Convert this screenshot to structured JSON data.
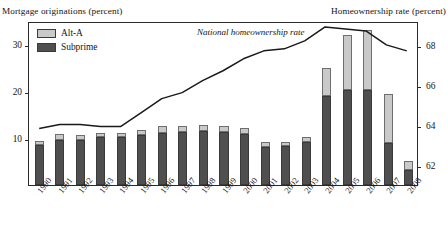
{
  "axis_captions": {
    "left": "Mortgage originations (percent)",
    "right": "Homeownership rate (percent)"
  },
  "legend": {
    "items": [
      {
        "label": "Alt-A",
        "color": "#c9c9c9",
        "name": "legend-alt-a"
      },
      {
        "label": "Subprime",
        "color": "#4f4f4f",
        "name": "legend-subprime"
      }
    ]
  },
  "annotation": "National homeownership rate",
  "chart_data": {
    "type": "bar",
    "title": "",
    "subtitle": "",
    "xlabel": "",
    "ylabel": "Mortgage originations (percent)",
    "y2label": "Homeownership rate (percent)",
    "grid": false,
    "legend_position": "top-left",
    "stacked": true,
    "categories": [
      "1990",
      "1991",
      "1992",
      "1993",
      "1994",
      "1995",
      "1996",
      "1997",
      "1998",
      "1999",
      "2000",
      "2001",
      "2002",
      "2003",
      "2004",
      "2005",
      "2006",
      "2007",
      "2008"
    ],
    "ylim": [
      0,
      35
    ],
    "yticks": [
      10,
      20,
      30
    ],
    "y2lim": [
      61,
      69.2
    ],
    "y2ticks": [
      62,
      64,
      66,
      68
    ],
    "series": [
      {
        "name": "Subprime",
        "color": "#4f4f4f",
        "axis": "left",
        "values": [
          8.6,
          9.7,
          9.7,
          10.3,
          10.2,
          10.6,
          11.2,
          11.4,
          11.5,
          11.4,
          10.8,
          8.2,
          8.3,
          9.2,
          19.0,
          20.2,
          20.3,
          8.9,
          3.3
        ]
      },
      {
        "name": "Alt-A",
        "color": "#c9c9c9",
        "axis": "left",
        "values": [
          0.9,
          1.1,
          1.0,
          0.9,
          1.0,
          1.1,
          1.4,
          1.3,
          1.3,
          1.2,
          1.3,
          0.9,
          0.9,
          1.1,
          6.0,
          11.8,
          12.7,
          10.6,
          1.9
        ]
      },
      {
        "name": "National homeownership rate",
        "color": "#1a1a1a",
        "axis": "right",
        "type": "line",
        "values": [
          63.9,
          64.1,
          64.1,
          64.0,
          64.0,
          64.7,
          65.4,
          65.7,
          66.3,
          66.8,
          67.4,
          67.8,
          67.9,
          68.3,
          69.0,
          68.9,
          68.8,
          68.1,
          67.8
        ]
      }
    ]
  }
}
